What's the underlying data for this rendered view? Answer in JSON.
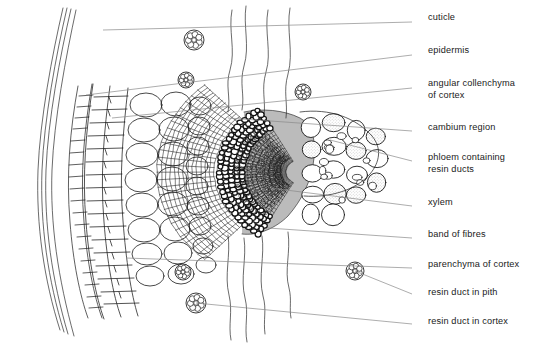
{
  "figure": {
    "style": "line-drawing",
    "ink_color": "#1a1a1a",
    "leader_color": "#8a8a8a",
    "background_color": "#ffffff",
    "stipple_color": "#9a9a9a"
  },
  "labels": [
    {
      "id": "cuticle",
      "text": "cuticle",
      "x": 428,
      "y": 18,
      "leader": {
        "x1": 412,
        "y1": 22,
        "x2": 103,
        "y2": 30
      }
    },
    {
      "id": "epidermis",
      "text": "epidermis",
      "x": 428,
      "y": 51,
      "leader": {
        "x1": 412,
        "y1": 55,
        "x2": 86,
        "y2": 95
      }
    },
    {
      "id": "angular-collenchyma",
      "text": "angular collenchyma",
      "x": 428,
      "y": 84,
      "line2": "of cortex",
      "leader": {
        "x1": 412,
        "y1": 88,
        "x2": 112,
        "y2": 118
      }
    },
    {
      "id": "cambium-region",
      "text": "cambium region",
      "x": 428,
      "y": 128,
      "leader": {
        "x1": 412,
        "y1": 131,
        "x2": 228,
        "y2": 118
      }
    },
    {
      "id": "phloem-resin-ducts",
      "text": "phloem containing",
      "x": 428,
      "y": 158,
      "line2": "resin ducts",
      "leader": {
        "x1": 412,
        "y1": 161,
        "x2": 330,
        "y2": 140
      }
    },
    {
      "id": "xylem",
      "text": "xylem",
      "x": 428,
      "y": 203,
      "leader": {
        "x1": 412,
        "y1": 206,
        "x2": 270,
        "y2": 188
      }
    },
    {
      "id": "band-of-fibres",
      "text": "band of fibres",
      "x": 428,
      "y": 235,
      "leader": {
        "x1": 412,
        "y1": 238,
        "x2": 268,
        "y2": 228
      }
    },
    {
      "id": "parenchyma-of-cortex",
      "text": "parenchyma of cortex",
      "x": 428,
      "y": 265,
      "leader": {
        "x1": 412,
        "y1": 268,
        "x2": 126,
        "y2": 258
      }
    },
    {
      "id": "resin-duct-in-pith",
      "text": "resin duct in pith",
      "x": 428,
      "y": 293,
      "leader": {
        "x1": 412,
        "y1": 294,
        "x2": 355,
        "y2": 271
      }
    },
    {
      "id": "resin-duct-in-cortex",
      "text": "resin duct in cortex",
      "x": 428,
      "y": 322,
      "leader": {
        "x1": 412,
        "y1": 324,
        "x2": 196,
        "y2": 303
      }
    }
  ],
  "tissue_zones": [
    {
      "id": "cuticle",
      "description": "outermost thin multi-line boundary at left margin"
    },
    {
      "id": "epidermis",
      "description": "narrow column of small rectangular cells inside cuticle"
    },
    {
      "id": "collenchyma",
      "description": "band of small angular thickened cells"
    },
    {
      "id": "cortex",
      "description": "broad zone of large rounded parenchyma cells"
    },
    {
      "id": "phloem",
      "description": "dense small cells with stippled resin ducts"
    },
    {
      "id": "cambium",
      "description": "dark narrow band of flattened cells"
    },
    {
      "id": "xylem",
      "description": "radial files of small cells at bundle centre"
    },
    {
      "id": "fibres",
      "description": "dark heavily thickened band bordering the bundle"
    },
    {
      "id": "pith",
      "description": "large rounded cells right of bundle"
    }
  ],
  "resin_ducts": [
    {
      "id": "duct-cortex-upper-1",
      "cx": 194,
      "cy": 40,
      "r": 10,
      "location": "cortex"
    },
    {
      "id": "duct-cortex-upper-2",
      "cx": 186,
      "cy": 80,
      "r": 8,
      "location": "cortex"
    },
    {
      "id": "duct-cortex-upper-3",
      "cx": 303,
      "cy": 92,
      "r": 8,
      "location": "cortex"
    },
    {
      "id": "duct-cortex-lower-1",
      "cx": 183,
      "cy": 272,
      "r": 8,
      "location": "cortex"
    },
    {
      "id": "duct-cortex-lower-2",
      "cx": 196,
      "cy": 303,
      "r": 10,
      "location": "cortex"
    },
    {
      "id": "duct-pith-right",
      "cx": 355,
      "cy": 271,
      "r": 9,
      "location": "pith"
    }
  ]
}
